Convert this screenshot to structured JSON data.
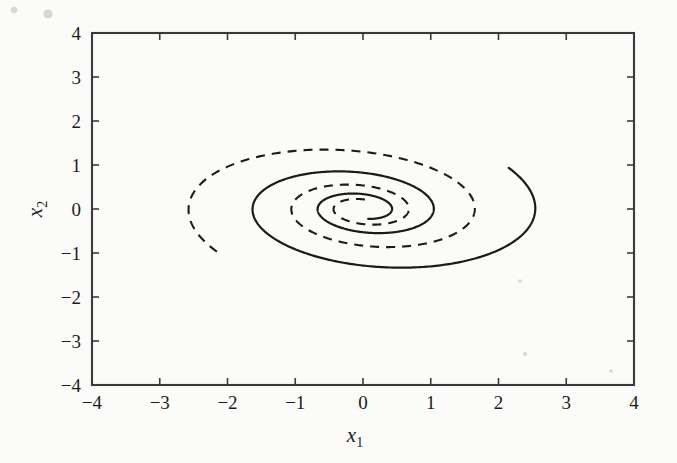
{
  "figure": {
    "background_color": "#fbfbf9",
    "line_color": "#1b1b1b",
    "axis_color": "#3a3a3a"
  },
  "chart_data": {
    "type": "line",
    "title": "",
    "xlabel": "x_1",
    "xlabel_base": "x",
    "xlabel_sub": "1",
    "ylabel": "x_2",
    "ylabel_base": "x",
    "ylabel_sub": "2",
    "xlim": [
      -4,
      4
    ],
    "ylim": [
      -4,
      4
    ],
    "xticks": [
      -4,
      -3,
      -2,
      -1,
      0,
      1,
      2,
      3,
      4
    ],
    "yticks": [
      -4,
      -3,
      -2,
      -1,
      0,
      1,
      2,
      3,
      4
    ],
    "xtick_labels": [
      "−4",
      "−3",
      "−2",
      "−1",
      "0",
      "1",
      "2",
      "3",
      "4"
    ],
    "ytick_labels": [
      "−4",
      "−3",
      "−2",
      "−1",
      "0",
      "1",
      "2",
      "3",
      "4"
    ],
    "grid": false,
    "legend": "none",
    "annotations": [],
    "series": [
      {
        "name": "trajectory-solid",
        "style": "solid",
        "start_point": [
          2.0,
          1.95
        ],
        "end_point": [
          0.0,
          0.0
        ],
        "spiral": {
          "r0": 2.79,
          "theta0": 0.772,
          "decay": 0.1415,
          "omega": -1.0,
          "theta_span": 14.6,
          "aspect_x": 1.0,
          "aspect_y": 0.63,
          "tilt_deg": -8.0
        },
        "extrema": {
          "x_max": 3.85,
          "x_min": -1.03,
          "y_max": 1.95,
          "y_min": -1.2
        }
      },
      {
        "name": "trajectory-dashed",
        "style": "dashed",
        "start_point": [
          -2.0,
          -2.0
        ],
        "end_point": [
          0.0,
          0.0
        ],
        "spiral": {
          "r0": 2.83,
          "theta0": 3.927,
          "decay": 0.1415,
          "omega": -1.0,
          "theta_span": 15.2,
          "aspect_x": 1.0,
          "aspect_y": 0.63,
          "tilt_deg": -8.0
        },
        "extrema": {
          "x_max": 3.0,
          "x_min": -3.48,
          "y_max": 2.48,
          "y_min": -2.0
        }
      }
    ]
  },
  "plot_geometry": {
    "left_px": 92,
    "right_px": 634,
    "top_px": 33,
    "bottom_px": 385
  }
}
